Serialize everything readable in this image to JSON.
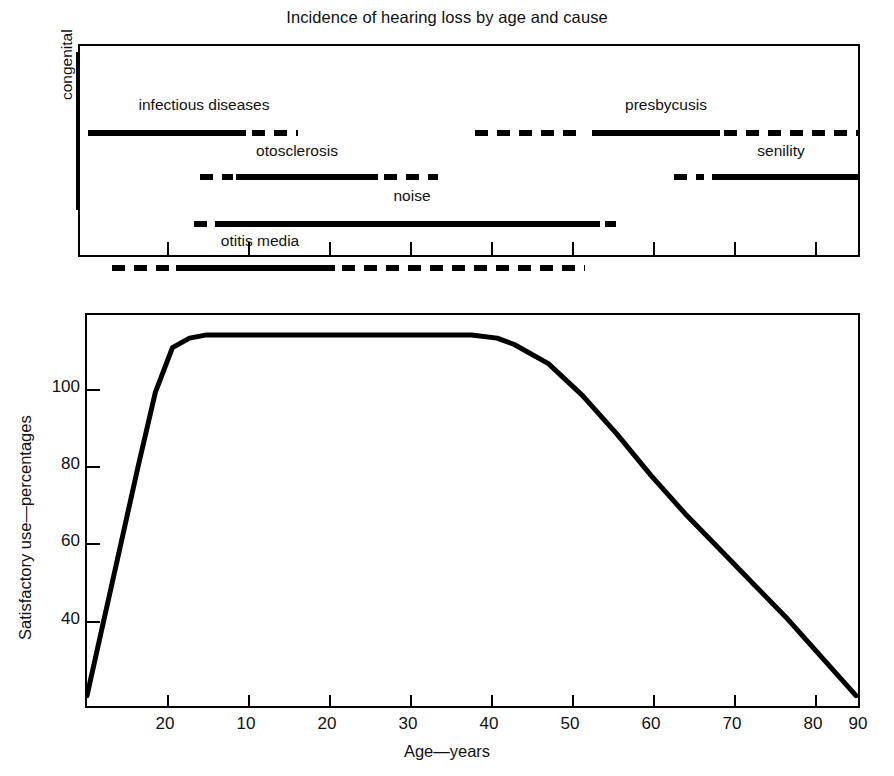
{
  "figure": {
    "title": "Incidence of hearing loss by age and cause",
    "xlabel": "Age—years",
    "ylabel": "Satisfactory use—percentages"
  },
  "chart_data": [
    {
      "type": "bar",
      "id": "incidence-timeline",
      "title": "Incidence of hearing loss by age and cause",
      "xlabel": "Age—years",
      "ylabel": "",
      "axis_note": "congenital",
      "xticklabels": [
        "20",
        "10",
        "20",
        "30",
        "40",
        "50",
        "60",
        "70",
        "80",
        "90"
      ],
      "xtick_positions_px": [
        165,
        246,
        327,
        408,
        489,
        570,
        651,
        732,
        813,
        860
      ],
      "grid": false,
      "legend": "none",
      "categories": [
        "infectious diseases",
        "otosclerosis",
        "noise",
        "otitis media",
        "presbycusis",
        "senility"
      ],
      "bars": [
        {
          "label": "infectious diseases",
          "label_x_px": 202,
          "label_y_px": 64,
          "row_y_px": 84,
          "segments": [
            {
              "style": "solid",
              "x0_px": 86,
              "x1_px": 244
            },
            {
              "style": "dashed",
              "x0_px": 250,
              "x1_px": 296
            }
          ]
        },
        {
          "label": "otosclerosis",
          "label_x_px": 295,
          "label_y_px": 110,
          "row_y_px": 128,
          "segments": [
            {
              "style": "dashed",
              "x0_px": 198,
              "x1_px": 231
            },
            {
              "style": "solid",
              "x0_px": 234,
              "x1_px": 376
            },
            {
              "style": "dashed",
              "x0_px": 382,
              "x1_px": 436
            }
          ]
        },
        {
          "label": "noise",
          "label_x_px": 410,
          "label_y_px": 155,
          "row_y_px": 175,
          "segments": [
            {
              "style": "dashed",
              "x0_px": 192,
              "x1_px": 206
            },
            {
              "style": "solid",
              "x0_px": 213,
              "x1_px": 598
            },
            {
              "style": "dashed",
              "x0_px": 603,
              "x1_px": 614
            }
          ]
        },
        {
          "label": "otitis media",
          "label_x_px": 258,
          "label_y_px": 200,
          "row_y_px": 219,
          "segments": [
            {
              "style": "dashed",
              "x0_px": 110,
              "x1_px": 170
            },
            {
              "style": "solid",
              "x0_px": 174,
              "x1_px": 333
            },
            {
              "style": "dashed",
              "x0_px": 340,
              "x1_px": 583
            }
          ]
        },
        {
          "label": "presbycusis",
          "label_x_px": 664,
          "label_y_px": 64,
          "row_y_px": 84,
          "segments": [
            {
              "style": "dashed",
              "x0_px": 473,
              "x1_px": 579
            },
            {
              "style": "solid",
              "x0_px": 590,
              "x1_px": 718
            },
            {
              "style": "dashed",
              "x0_px": 722,
              "x1_px": 858
            }
          ]
        },
        {
          "label": "senility",
          "label_x_px": 779,
          "label_y_px": 110,
          "row_y_px": 128,
          "segments": [
            {
              "style": "dashed",
              "x0_px": 672,
              "x1_px": 702
            },
            {
              "style": "solid",
              "x0_px": 710,
              "x1_px": 858
            }
          ]
        }
      ]
    },
    {
      "type": "line",
      "id": "satisfactory-use-curve",
      "title": "",
      "xlabel": "Age—years",
      "ylabel": "Satisfactory use—percentages",
      "grid": false,
      "legend": "none",
      "xticklabels": [
        "20",
        "10",
        "20",
        "30",
        "40",
        "50",
        "60",
        "70",
        "80",
        "90"
      ],
      "yticklabels": [
        "40",
        "60",
        "80",
        "100"
      ],
      "yticks": [
        40,
        60,
        80,
        100
      ],
      "ylim": [
        0,
        120
      ],
      "series": [
        {
          "name": "Satisfactory use",
          "x": [
            0,
            2,
            4,
            6,
            8,
            10,
            12,
            14,
            16,
            20,
            25,
            30,
            35,
            40,
            45,
            48,
            50,
            54,
            58,
            62,
            66,
            70,
            74,
            78,
            82,
            86,
            90
          ],
          "values": [
            2,
            26,
            50,
            74,
            97,
            111,
            114,
            115,
            115,
            115,
            115,
            115,
            115,
            115,
            115,
            114,
            112,
            106,
            96,
            84,
            71,
            59,
            48,
            37,
            26,
            14,
            2
          ]
        }
      ]
    }
  ],
  "top_panel": {
    "congenital_label": "congenital"
  },
  "bottom_panel": {
    "yticks": [
      {
        "label": "100",
        "y_px": 74
      },
      {
        "label": "80",
        "y_px": 151
      },
      {
        "label": "60",
        "y_px": 228
      },
      {
        "label": "40",
        "y_px": 306
      }
    ],
    "xticks": [
      {
        "label": "20",
        "x_px": 80
      },
      {
        "label": "10",
        "x_px": 161
      },
      {
        "label": "20",
        "x_px": 242
      },
      {
        "label": "30",
        "x_px": 323
      },
      {
        "label": "40",
        "x_px": 404
      },
      {
        "label": "50",
        "x_px": 485
      },
      {
        "label": "60",
        "x_px": 566
      },
      {
        "label": "70",
        "x_px": 647
      },
      {
        "label": "80",
        "x_px": 728
      },
      {
        "label": "90",
        "x_px": 773
      }
    ]
  },
  "colors": {
    "ink": "#000000",
    "background": "#ffffff"
  }
}
